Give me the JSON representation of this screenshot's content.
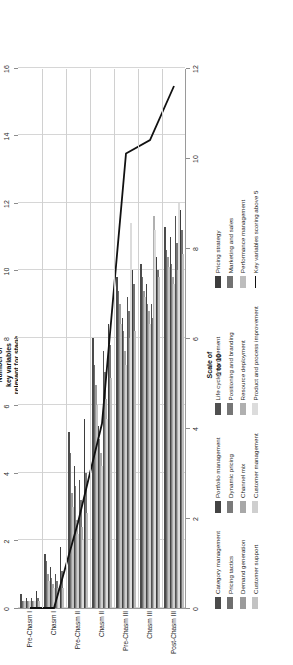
{
  "chart_data": {
    "type": "bar",
    "title": "",
    "orientation": "horizontal-rotated",
    "xlabel": "Number of\nkey variables\nrelevant for stage",
    "ylabel": "Scale of\n1 to 10",
    "categories": [
      "Pre-Chasm I",
      "Chasm I",
      "Pre-Chasm II",
      "Chasm II",
      "Pre-Chasm III",
      "Chasm III",
      "Post-Chasm III"
    ],
    "bar_axis": {
      "label": "Number of key variables relevant for stage",
      "ticks": [
        0,
        2,
        4,
        6,
        8,
        10,
        12,
        14,
        16
      ],
      "ylim": [
        0,
        16
      ],
      "grid": true
    },
    "line_axis": {
      "label": "Scale of 1 to 10",
      "ticks": [
        0,
        2,
        4,
        6,
        8,
        10,
        12
      ],
      "ylim": [
        0,
        12
      ],
      "grid": true
    },
    "legend_position": "below",
    "series": [
      {
        "name": "Category management",
        "color": "#4b4b4b",
        "values": [
          0.4,
          1.6,
          5.2,
          8.0,
          9.8,
          10.2,
          11.3
        ]
      },
      {
        "name": "Pricing tactics",
        "color": "#6e6e6e",
        "values": [
          0.2,
          1.4,
          4.6,
          7.2,
          9.4,
          9.8,
          10.6
        ]
      },
      {
        "name": "Demand generation",
        "color": "#9b9b9b",
        "values": [
          0.2,
          1.0,
          3.4,
          6.6,
          9.0,
          9.4,
          10.4
        ]
      },
      {
        "name": "Customer support",
        "color": "#c3c3c3",
        "values": [
          0.2,
          0.8,
          3.0,
          6.0,
          8.4,
          9.2,
          10.1
        ]
      },
      {
        "name": "Portfolio management",
        "color": "#434343",
        "values": [
          0.3,
          1.2,
          4.2,
          5.4,
          8.6,
          9.6,
          11.0
        ]
      },
      {
        "name": "Dynamic pricing",
        "color": "#7a7a7a",
        "values": [
          0.2,
          0.9,
          3.6,
          5.0,
          8.2,
          9.0,
          10.2
        ]
      },
      {
        "name": "Channel mix",
        "color": "#a8a8a8",
        "values": [
          0.2,
          0.7,
          2.6,
          4.6,
          7.6,
          8.8,
          9.8
        ]
      },
      {
        "name": "Customer management",
        "color": "#cfcfcf",
        "values": [
          0.2,
          0.6,
          2.2,
          4.2,
          7.2,
          8.4,
          9.6
        ]
      },
      {
        "name": "Life cycle management",
        "color": "#505050",
        "values": [
          0.3,
          1.0,
          3.8,
          7.6,
          9.2,
          9.0,
          11.6
        ]
      },
      {
        "name": "Positioning and branding",
        "color": "#767676",
        "values": [
          0.2,
          0.8,
          3.2,
          7.0,
          8.8,
          8.6,
          10.8
        ]
      },
      {
        "name": "Resource deployment",
        "color": "#b0b0b0",
        "values": [
          0.2,
          0.6,
          2.4,
          6.2,
          8.0,
          11.6,
          10.0
        ]
      },
      {
        "name": "Product and process improvement",
        "color": "#dcdcdc",
        "values": [
          0.2,
          0.5,
          2.0,
          5.6,
          11.4,
          11.2,
          12.0
        ]
      },
      {
        "name": "Pricing strategy",
        "color": "#3d3d3d",
        "values": [
          0.5,
          1.8,
          5.6,
          8.4,
          10.0,
          10.4,
          11.8
        ]
      },
      {
        "name": "Marketing and sales",
        "color": "#727272",
        "values": [
          0.3,
          1.1,
          4.0,
          7.8,
          9.6,
          10.0,
          11.2
        ]
      },
      {
        "name": "Performance management",
        "color": "#bdbdbd",
        "values": [
          0.2,
          0.6,
          2.8,
          6.8,
          8.2,
          9.8,
          10.5
        ]
      }
    ],
    "line_series": {
      "name": "Key variables scoring above 5",
      "color": "#111111",
      "values": [
        0.0,
        0.0,
        1.9,
        4.1,
        10.1,
        10.4,
        11.6
      ]
    }
  },
  "legend": {
    "columns": [
      {
        "items": [
          {
            "label": "Category management",
            "color": "#4b4b4b",
            "type": "swatch"
          },
          {
            "label": "Pricing tactics",
            "color": "#6e6e6e",
            "type": "swatch"
          },
          {
            "label": "Demand generation",
            "color": "#9b9b9b",
            "type": "swatch"
          },
          {
            "label": "Customer support",
            "color": "#c3c3c3",
            "type": "swatch"
          }
        ]
      },
      {
        "items": [
          {
            "label": "Portfolio management",
            "color": "#434343",
            "type": "swatch"
          },
          {
            "label": "Dynamic pricing",
            "color": "#7a7a7a",
            "type": "swatch"
          },
          {
            "label": "Channel mix",
            "color": "#a8a8a8",
            "type": "swatch"
          },
          {
            "label": "Customer management",
            "color": "#cfcfcf",
            "type": "swatch"
          }
        ]
      },
      {
        "items": [
          {
            "label": "Life cycle management",
            "color": "#505050",
            "type": "swatch"
          },
          {
            "label": "Positioning and branding",
            "color": "#767676",
            "type": "swatch"
          },
          {
            "label": "Resource deployment",
            "color": "#b0b0b0",
            "type": "swatch"
          },
          {
            "label": "Product and process improvement",
            "color": "#dcdcdc",
            "type": "swatch"
          }
        ]
      },
      {
        "items": [
          {
            "label": "Pricing strategy",
            "color": "#3d3d3d",
            "type": "swatch"
          },
          {
            "label": "Marketing and sales",
            "color": "#727272",
            "type": "swatch"
          },
          {
            "label": "Performance management",
            "color": "#bdbdbd",
            "type": "swatch"
          },
          {
            "label": "Key variables scoring above 5",
            "color": "#111111",
            "type": "line"
          }
        ]
      }
    ]
  }
}
